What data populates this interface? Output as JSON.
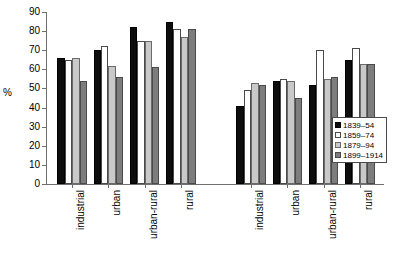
{
  "chart_data": {
    "type": "bar",
    "title": "",
    "subtitle": "",
    "xlabel": "",
    "ylabel": "%",
    "ylim": [
      0,
      90
    ],
    "ytick_step": 10,
    "yticks": [
      0,
      10,
      20,
      30,
      40,
      50,
      60,
      70,
      80,
      90
    ],
    "grid": false,
    "legend_position": "right",
    "panels": [
      {
        "name": "panel-left",
        "categories": [
          "industrial",
          "urban",
          "urban-rural",
          "rural"
        ]
      },
      {
        "name": "panel-right",
        "categories": [
          "industrial",
          "urban",
          "urban-rural",
          "rural"
        ]
      }
    ],
    "categories": [
      "industrial",
      "urban",
      "urban-rural",
      "rural",
      "industrial",
      "urban",
      "urban-rural",
      "rural"
    ],
    "series": [
      {
        "name": "1839–54",
        "color": "#0d0d0d",
        "values": [
          66,
          70,
          82,
          85,
          41,
          54,
          52,
          65
        ]
      },
      {
        "name": "1859–74",
        "color": "#ffffff",
        "values": [
          65,
          72,
          75,
          81,
          49,
          55,
          70,
          71
        ]
      },
      {
        "name": "1879–94",
        "color": "#c9c9c9",
        "values": [
          66,
          62,
          75,
          77,
          53,
          54,
          55,
          63
        ]
      },
      {
        "name": "1899–1914",
        "color": "#7d7d7d",
        "values": [
          54,
          56,
          61,
          81,
          52,
          45,
          56,
          63
        ]
      }
    ]
  },
  "legend": {
    "entries": [
      {
        "label": "1839–54",
        "color": "#0d0d0d"
      },
      {
        "label": "1859–74",
        "color": "#ffffff"
      },
      {
        "label": "1879–94",
        "color": "#c9c9c9"
      },
      {
        "label": "1899–1914",
        "color": "#7d7d7d"
      }
    ]
  }
}
